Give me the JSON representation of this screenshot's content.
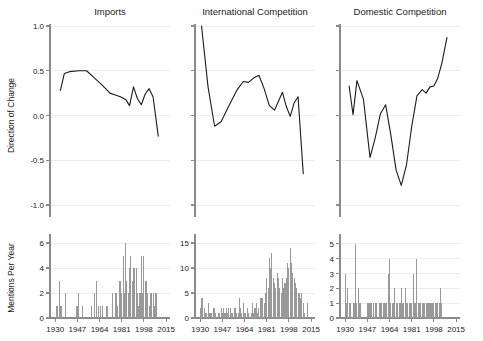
{
  "figure": {
    "width": 483,
    "height": 341,
    "background": "#ffffff",
    "line_color": "#1a1a1a",
    "bar_color": "#999999",
    "grid_color": "#ececec",
    "axis_color": "#8a8a8a"
  },
  "shared": {
    "x_ticks": [
      1930,
      1947,
      1964,
      1981,
      1998,
      2015
    ],
    "x_tick_labels": [
      "1930",
      "1947",
      "1964",
      "1981",
      "1998",
      "2015"
    ],
    "x_range": [
      1926,
      2018
    ],
    "top_ylabel": "Direction of Change",
    "bottom_ylabel": "Mentions Per Year",
    "top_y_ticks": [
      1.0,
      0.5,
      0.0,
      -0.5,
      -1.0
    ],
    "top_y_tick_labels": [
      "1.0",
      "0.5",
      "0.0",
      "-0.5",
      "-1.0"
    ],
    "top_ylim": [
      -1.0,
      1.0
    ],
    "grid": true,
    "legend": "none"
  },
  "chart_data": [
    {
      "type": "line",
      "panel": "top-left",
      "title": "Imports",
      "xlabel": "",
      "ylabel": "Direction of Change",
      "ylim": [
        -1.0,
        1.0
      ],
      "xlim": [
        1926,
        2018
      ],
      "yticks": [
        1.0,
        0.5,
        0.0,
        -0.5,
        -1.0
      ],
      "x": [
        1934,
        1937,
        1941,
        1948,
        1954,
        1960,
        1966,
        1972,
        1976,
        1980,
        1984,
        1987,
        1990,
        1993,
        1996,
        1999,
        2002,
        2005,
        2009
      ],
      "values": [
        0.28,
        0.47,
        0.49,
        0.5,
        0.5,
        0.42,
        0.34,
        0.25,
        0.23,
        0.21,
        0.18,
        0.11,
        0.32,
        0.19,
        0.12,
        0.24,
        0.3,
        0.21,
        -0.23
      ]
    },
    {
      "type": "line",
      "panel": "top-middle",
      "title": "International Competition",
      "xlabel": "",
      "ylabel": "Direction of Change",
      "ylim": [
        -1.0,
        1.0
      ],
      "xlim": [
        1926,
        2018
      ],
      "yticks": [
        1.0,
        0.5,
        0.0,
        -0.5,
        -1.0
      ],
      "x": [
        1931,
        1936,
        1941,
        1946,
        1952,
        1958,
        1963,
        1967,
        1971,
        1975,
        1979,
        1983,
        1987,
        1990,
        1993,
        1996,
        1999,
        2002,
        2005,
        2009
      ],
      "values": [
        1.0,
        0.32,
        -0.12,
        -0.07,
        0.11,
        0.28,
        0.38,
        0.37,
        0.42,
        0.45,
        0.3,
        0.11,
        0.06,
        0.16,
        0.26,
        0.1,
        -0.01,
        0.14,
        0.21,
        -0.65
      ]
    },
    {
      "type": "line",
      "panel": "top-right",
      "title": "Domestic Competition",
      "xlabel": "",
      "ylabel": "Direction of Change",
      "ylim": [
        -1.0,
        1.0
      ],
      "xlim": [
        1926,
        2018
      ],
      "yticks": [
        1.0,
        0.5,
        0.0,
        -0.5,
        -1.0
      ],
      "x": [
        1933,
        1936,
        1939,
        1944,
        1949,
        1953,
        1957,
        1961,
        1965,
        1969,
        1973,
        1977,
        1981,
        1985,
        1989,
        1992,
        1995,
        1998,
        2001,
        2004,
        2008
      ],
      "values": [
        0.33,
        0.01,
        0.39,
        0.18,
        -0.47,
        -0.25,
        0.02,
        0.12,
        -0.22,
        -0.61,
        -0.78,
        -0.55,
        -0.12,
        0.22,
        0.29,
        0.25,
        0.32,
        0.33,
        0.42,
        0.58,
        0.87
      ]
    },
    {
      "type": "bar",
      "panel": "bottom-left",
      "title": "",
      "xlabel": "",
      "ylabel": "Mentions Per Year",
      "ylim": [
        0,
        6.4
      ],
      "xlim": [
        1926,
        2018
      ],
      "yticks": [
        0,
        2,
        4,
        6
      ],
      "ytick_labels": [
        "0",
        "2",
        "4",
        "6"
      ],
      "categories": [
        1930,
        1931,
        1932,
        1933,
        1934,
        1935,
        1936,
        1937,
        1938,
        1939,
        1940,
        1941,
        1942,
        1943,
        1944,
        1945,
        1946,
        1947,
        1948,
        1949,
        1950,
        1951,
        1952,
        1953,
        1954,
        1955,
        1956,
        1957,
        1958,
        1959,
        1960,
        1961,
        1962,
        1963,
        1964,
        1965,
        1966,
        1967,
        1968,
        1969,
        1970,
        1971,
        1972,
        1973,
        1974,
        1975,
        1976,
        1977,
        1978,
        1979,
        1980,
        1981,
        1982,
        1983,
        1984,
        1985,
        1986,
        1987,
        1988,
        1989,
        1990,
        1991,
        1992,
        1993,
        1994,
        1995,
        1996,
        1997,
        1998,
        1999,
        2000,
        2001,
        2002,
        2003,
        2004,
        2005,
        2006,
        2007,
        2008,
        2009,
        2010,
        2011
      ],
      "values": [
        0,
        1,
        1,
        3,
        1,
        1,
        0,
        0,
        2,
        0,
        0,
        0,
        0,
        0,
        0,
        0,
        1,
        1,
        2,
        0,
        0,
        1,
        0,
        0,
        0,
        0,
        0,
        0,
        1,
        0,
        2,
        0,
        3,
        1,
        0,
        1,
        1,
        0,
        0,
        1,
        1,
        0,
        0,
        0,
        2,
        0,
        2,
        2,
        1,
        3,
        3,
        2,
        5,
        2,
        6,
        3,
        2,
        4,
        5,
        3,
        4,
        4,
        4,
        2,
        1,
        2,
        5,
        2,
        5,
        3,
        3,
        2,
        1,
        2,
        2,
        2,
        1,
        2,
        2,
        0,
        0,
        0
      ]
    },
    {
      "type": "bar",
      "panel": "bottom-middle",
      "title": "",
      "xlabel": "",
      "ylabel": "Mentions Per Year",
      "ylim": [
        0,
        16
      ],
      "xlim": [
        1926,
        2018
      ],
      "yticks": [
        0,
        5,
        10,
        15
      ],
      "ytick_labels": [
        "0",
        "5",
        "10",
        "15"
      ],
      "categories": [
        1930,
        1931,
        1932,
        1933,
        1934,
        1935,
        1936,
        1937,
        1938,
        1939,
        1940,
        1941,
        1942,
        1943,
        1944,
        1945,
        1946,
        1947,
        1948,
        1949,
        1950,
        1951,
        1952,
        1953,
        1954,
        1955,
        1956,
        1957,
        1958,
        1959,
        1960,
        1961,
        1962,
        1963,
        1964,
        1965,
        1966,
        1967,
        1968,
        1969,
        1970,
        1971,
        1972,
        1973,
        1974,
        1975,
        1976,
        1977,
        1978,
        1979,
        1980,
        1981,
        1982,
        1983,
        1984,
        1985,
        1986,
        1987,
        1988,
        1989,
        1990,
        1991,
        1992,
        1993,
        1994,
        1995,
        1996,
        1997,
        1998,
        1999,
        2000,
        2001,
        2002,
        2003,
        2004,
        2005,
        2006,
        2007,
        2008,
        2009,
        2010,
        2011,
        2012
      ],
      "values": [
        2,
        4,
        4,
        2,
        1,
        1,
        3,
        1,
        1,
        1,
        2,
        2,
        1,
        0,
        1,
        1,
        2,
        1,
        2,
        1,
        2,
        1,
        2,
        2,
        1,
        1,
        2,
        2,
        1,
        1,
        4,
        2,
        1,
        3,
        1,
        1,
        2,
        1,
        0,
        1,
        3,
        1,
        2,
        3,
        1,
        2,
        4,
        4,
        4,
        3,
        5,
        8,
        6,
        12,
        10,
        13,
        8,
        7,
        6,
        9,
        8,
        6,
        5,
        8,
        6,
        7,
        8,
        11,
        10,
        14,
        11,
        9,
        8,
        7,
        6,
        5,
        5,
        4,
        5,
        3,
        1,
        0,
        3
      ]
    },
    {
      "type": "bar",
      "panel": "bottom-right",
      "title": "",
      "xlabel": "",
      "ylabel": "Mentions Per Year",
      "ylim": [
        0,
        5.4
      ],
      "xlim": [
        1926,
        2018
      ],
      "yticks": [
        0,
        1,
        2,
        3,
        4,
        5
      ],
      "ytick_labels": [
        "0",
        "1",
        "2",
        "3",
        "4",
        "5"
      ],
      "categories": [
        1930,
        1931,
        1932,
        1933,
        1934,
        1935,
        1936,
        1937,
        1938,
        1939,
        1940,
        1941,
        1942,
        1943,
        1944,
        1945,
        1946,
        1947,
        1948,
        1949,
        1950,
        1951,
        1952,
        1953,
        1954,
        1955,
        1956,
        1957,
        1958,
        1959,
        1960,
        1961,
        1962,
        1963,
        1964,
        1965,
        1966,
        1967,
        1968,
        1969,
        1970,
        1971,
        1972,
        1973,
        1974,
        1975,
        1976,
        1977,
        1978,
        1979,
        1980,
        1981,
        1982,
        1983,
        1984,
        1985,
        1986,
        1987,
        1988,
        1989,
        1990,
        1991,
        1992,
        1993,
        1994,
        1995,
        1996,
        1997,
        1998,
        1999,
        2000,
        2001,
        2002,
        2003,
        2004,
        2005,
        2006,
        2007,
        2008
      ],
      "values": [
        3,
        1,
        2,
        1,
        1,
        0,
        1,
        1,
        5,
        1,
        2,
        1,
        1,
        0,
        0,
        0,
        0,
        1,
        1,
        1,
        1,
        0,
        1,
        1,
        1,
        0,
        1,
        1,
        1,
        1,
        1,
        1,
        1,
        3,
        4,
        1,
        1,
        1,
        2,
        1,
        1,
        0,
        1,
        2,
        1,
        1,
        2,
        1,
        1,
        1,
        1,
        1,
        3,
        1,
        1,
        4,
        1,
        1,
        1,
        1,
        1,
        1,
        1,
        1,
        1,
        1,
        1,
        1,
        1,
        1,
        1,
        1,
        1,
        2,
        1,
        0,
        0,
        0,
        0
      ]
    }
  ]
}
